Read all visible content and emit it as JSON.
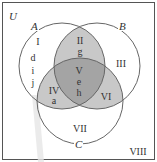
{
  "diagram": {
    "type": "venn",
    "universal_label": "U",
    "sets": [
      {
        "id": "A",
        "label": "A"
      },
      {
        "id": "B",
        "label": "B"
      },
      {
        "id": "C",
        "label": "C"
      }
    ],
    "regions": [
      {
        "id": "I",
        "label": "I",
        "membership": "A only",
        "elements": [
          "d",
          "i",
          "j"
        ]
      },
      {
        "id": "II",
        "label": "II",
        "membership": "A and B only",
        "elements": [
          "g"
        ]
      },
      {
        "id": "III",
        "label": "III",
        "membership": "B only",
        "elements": []
      },
      {
        "id": "IV",
        "label": "IV",
        "membership": "A and C only",
        "elements": [
          "a"
        ]
      },
      {
        "id": "V",
        "label": "V",
        "membership": "A and B and C",
        "elements": [
          "e",
          "h"
        ]
      },
      {
        "id": "VI",
        "label": "VI",
        "membership": "B and C only",
        "elements": []
      },
      {
        "id": "VII",
        "label": "VII",
        "membership": "C only",
        "elements": []
      },
      {
        "id": "VIII",
        "label": "VIII",
        "membership": "outside A, B, C",
        "elements": []
      }
    ],
    "colors": {
      "background": "#ffffff",
      "border": "#555555",
      "circle_stroke": "#666666",
      "two_set_overlap": "#c8c8c8",
      "triple_overlap": "#a4a4a4",
      "text": "#333333"
    }
  }
}
